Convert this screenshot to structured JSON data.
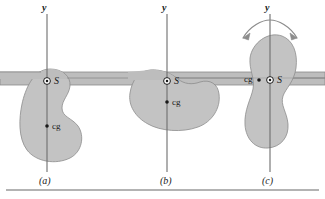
{
  "figure": {
    "kind": "physics-diagram",
    "colors": {
      "blob_fill": "#c3c3c3",
      "blob_stroke": "#8a8a8a",
      "bar_fill": "#bdbdbd",
      "bar_stroke": "#8a8a8a",
      "axis_line": "#6d6d6d",
      "arrow": "#8c8c8c",
      "rule": "#9a9a9a",
      "text": "#1a1a1a"
    },
    "panels": [
      {
        "id": "a",
        "label": "(a)",
        "axis_label": "y",
        "pivot_label": "S",
        "cg_label": "cg",
        "has_rotation_arrow": false
      },
      {
        "id": "b",
        "label": "(b)",
        "axis_label": "y",
        "pivot_label": "S",
        "cg_label": "cg",
        "has_rotation_arrow": false
      },
      {
        "id": "c",
        "label": "(c)",
        "axis_label": "y",
        "pivot_label": "S",
        "cg_label": "cg",
        "has_rotation_arrow": true
      }
    ]
  }
}
